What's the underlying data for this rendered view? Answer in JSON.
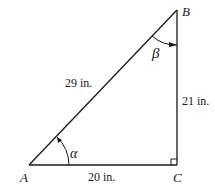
{
  "diagram": {
    "type": "right-triangle",
    "vertices": {
      "A": "A",
      "B": "B",
      "C": "C"
    },
    "sides": {
      "hypotenuse": "29 in.",
      "vertical": "21 in.",
      "base": "20 in."
    },
    "angles": {
      "at_A": "α",
      "at_B": "β"
    },
    "right_angle_at": "C",
    "line_color": "#1a1a1a"
  }
}
